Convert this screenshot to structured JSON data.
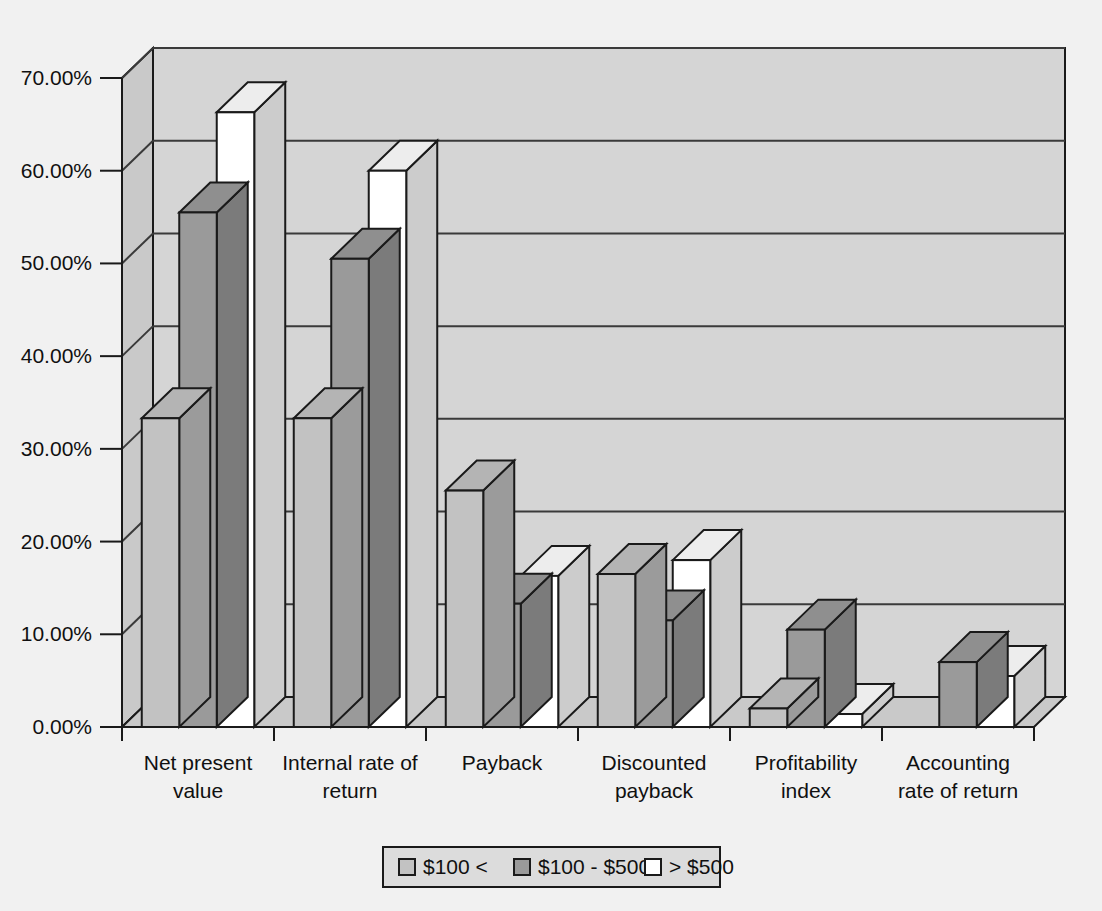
{
  "chart_data": {
    "type": "bar",
    "title": "",
    "subtitle": "",
    "xlabel": "",
    "ylabel": "",
    "ylim": [
      0,
      70
    ],
    "ytick_labels": [
      "0.00%",
      "10.00%",
      "20.00%",
      "30.00%",
      "40.00%",
      "50.00%",
      "60.00%",
      "70.00%"
    ],
    "ytick_values": [
      0,
      10,
      20,
      30,
      40,
      50,
      60,
      70
    ],
    "grid": true,
    "three_d": true,
    "legend_position": "bottom",
    "categories": [
      "Net present value",
      "Internal rate of return",
      "Payback",
      "Discounted payback",
      "Profitability index",
      "Accounting rate of return"
    ],
    "category_lines": [
      [
        "Net present",
        "value"
      ],
      [
        "Internal rate of",
        "return"
      ],
      [
        "Payback",
        ""
      ],
      [
        "Discounted",
        "payback"
      ],
      [
        "Profitability",
        "index"
      ],
      [
        "Accounting",
        "rate of return"
      ]
    ],
    "series": [
      {
        "name": "$100 <",
        "color": "#c2c2c2",
        "values": [
          33.3,
          33.3,
          25.5,
          16.5,
          2.0,
          0.0
        ]
      },
      {
        "name": "$100 - $500",
        "color": "#9a9a9a",
        "values": [
          55.5,
          50.5,
          13.3,
          11.5,
          10.5,
          7.0
        ]
      },
      {
        "name": "> $500",
        "color": "#ffffff",
        "values": [
          66.3,
          60.0,
          16.3,
          18.0,
          1.4,
          5.5
        ]
      }
    ]
  },
  "legend": {
    "items": [
      {
        "label": "$100 <",
        "swatch": "#c2c2c2"
      },
      {
        "label": "$100 - $500",
        "swatch": "#9a9a9a"
      },
      {
        "label": "> $500",
        "swatch": "#ffffff"
      }
    ]
  },
  "colors": {
    "page_background": "#f1f1f1",
    "plot_wall": "#d5d5d5",
    "plot_floor": "#c9c9c9",
    "side_wall": "#c9c9c9",
    "outline": "#1a1a1a",
    "gridline": "#3a3a3a",
    "legend_background": "#dcdcdc"
  }
}
